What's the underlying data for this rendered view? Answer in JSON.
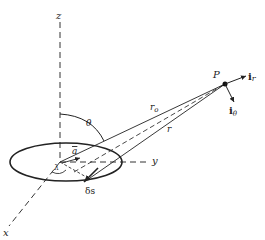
{
  "figure": {
    "labels": {
      "z_axis": "z",
      "x_axis": "x",
      "y_axis": "y",
      "point": "P",
      "unit_r": "i",
      "unit_r_sub": "r",
      "unit_theta": "i",
      "unit_theta_sub": "θ",
      "r0": "r",
      "r0_sub": "o",
      "r": "r",
      "theta": "θ",
      "radius": "a",
      "lambda": "λ",
      "element": "δs"
    },
    "colors": {
      "ink": "#222222",
      "background": "#ffffff"
    }
  }
}
